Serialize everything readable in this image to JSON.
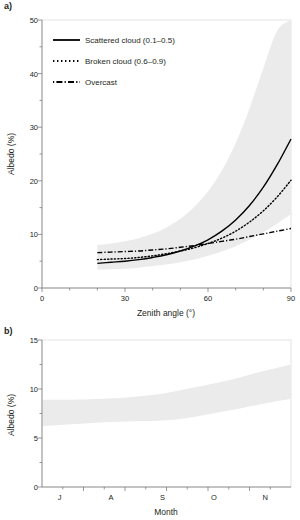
{
  "figure": {
    "panel_a_tag": "a)",
    "panel_b_tag": "b)"
  },
  "panel_a": {
    "legend": [
      {
        "label": "Scattered cloud (0.1–0.5)",
        "style": "solid",
        "name": "legend-item-scattered-cloud"
      },
      {
        "label": "Broken cloud (0.6–0.9)",
        "style": "dotted",
        "name": "legend-item-broken-cloud"
      },
      {
        "label": "Overcast",
        "style": "dashdot",
        "name": "legend-item-overcast"
      }
    ],
    "ylabel": "Albedo (%)",
    "xlabel": "Zenith angle (°)",
    "ytick_labels": [
      "0",
      "10",
      "20",
      "30",
      "40",
      "50"
    ],
    "xtick_labels": [
      "0",
      "30",
      "60",
      "90"
    ]
  },
  "panel_b": {
    "ylabel": "Albedo (%)",
    "xlabel": "Month",
    "ytick_labels": [
      "0",
      "5",
      "10",
      "15"
    ],
    "xtick_labels": [
      "J",
      "A",
      "S",
      "O",
      "N"
    ]
  },
  "colors": {
    "band": "#ebebeb",
    "line": "#000000",
    "axis": "#6d6e71",
    "frame": "#d6d6d6",
    "text": "#231f20"
  },
  "chart_data": [
    {
      "type": "line",
      "panel": "a",
      "title": "",
      "xlabel": "Zenith angle (°)",
      "ylabel": "Albedo (%)",
      "xlim": [
        0,
        90
      ],
      "ylim": [
        0,
        50
      ],
      "xticks": [
        0,
        30,
        60,
        90
      ],
      "yticks": [
        0,
        10,
        20,
        30,
        40,
        50
      ],
      "xminor_step": 10,
      "yminor_step": 5,
      "grid": false,
      "legend_position": "upper-left",
      "x": [
        20,
        25,
        30,
        35,
        40,
        45,
        50,
        55,
        60,
        65,
        70,
        75,
        80,
        85,
        90
      ],
      "series": [
        {
          "name": "Scattered cloud (0.1–0.5)",
          "style": "solid",
          "values": [
            4.6,
            4.8,
            5.0,
            5.3,
            5.7,
            6.2,
            6.9,
            7.8,
            9.0,
            10.6,
            12.7,
            15.4,
            18.8,
            23.0,
            27.8
          ]
        },
        {
          "name": "Broken cloud (0.6–0.9)",
          "style": "dotted",
          "values": [
            5.3,
            5.4,
            5.5,
            5.7,
            6.0,
            6.4,
            6.9,
            7.5,
            8.3,
            9.3,
            10.6,
            12.3,
            14.4,
            17.0,
            20.1
          ]
        },
        {
          "name": "Overcast",
          "style": "dashdot",
          "values": [
            6.6,
            6.7,
            6.8,
            6.9,
            7.1,
            7.3,
            7.6,
            7.9,
            8.3,
            8.7,
            9.1,
            9.6,
            10.1,
            10.6,
            11.1
          ]
        }
      ],
      "uncertainty_band": {
        "label": "shaded envelope",
        "color": "#ebebeb",
        "lower": [
          3.4,
          3.5,
          3.6,
          3.8,
          4.1,
          4.4,
          4.8,
          5.3,
          6.0,
          6.8,
          7.8,
          9.0,
          10.4,
          12.0,
          13.8
        ],
        "upper": [
          8.0,
          8.3,
          8.7,
          9.3,
          10.1,
          11.3,
          12.9,
          15.1,
          18.0,
          21.9,
          27.0,
          33.5,
          41.0,
          48.0,
          50.0
        ]
      }
    },
    {
      "type": "area",
      "panel": "b",
      "title": "",
      "xlabel": "Month",
      "ylabel": "Albedo (%)",
      "ylim": [
        0,
        15
      ],
      "yticks": [
        0,
        5,
        10,
        15
      ],
      "xticks": [
        "J",
        "A",
        "S",
        "O",
        "N"
      ],
      "grid": false,
      "categories": [
        "J",
        "A",
        "S",
        "O",
        "N"
      ],
      "uncertainty_band": {
        "label": "shaded envelope",
        "color": "#ebebeb",
        "x": [
          0.0,
          0.12,
          0.25,
          0.37,
          0.5,
          0.62,
          0.75,
          0.87,
          1.0
        ],
        "lower": [
          6.2,
          6.4,
          6.6,
          6.7,
          6.8,
          7.2,
          7.8,
          8.4,
          9.0
        ],
        "upper": [
          8.9,
          8.9,
          9.0,
          9.2,
          9.6,
          10.2,
          10.9,
          11.7,
          12.5
        ]
      }
    }
  ]
}
